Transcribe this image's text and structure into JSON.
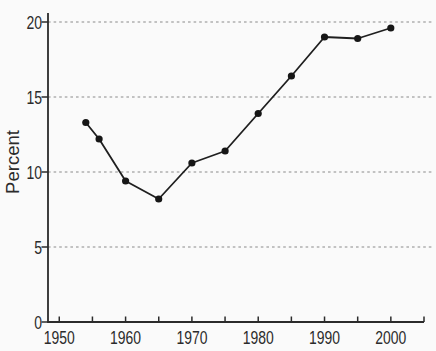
{
  "window": {
    "width": 436,
    "height": 351,
    "background": "#fafafa"
  },
  "chart_data": {
    "type": "line",
    "title": "",
    "xlabel": "",
    "ylabel": "Percent",
    "x": [
      1954,
      1956,
      1960,
      1965,
      1970,
      1975,
      1980,
      1985,
      1990,
      1995,
      2000
    ],
    "y": [
      13.3,
      12.2,
      9.4,
      8.2,
      10.6,
      11.4,
      13.9,
      16.4,
      19.0,
      18.9,
      19.6
    ],
    "xlim": [
      1948.3,
      2005
    ],
    "ylim": [
      0,
      20.6
    ],
    "xticks": [
      1950,
      1955,
      1960,
      1965,
      1970,
      1975,
      1980,
      1985,
      1990,
      1995,
      2000,
      2005
    ],
    "xtick_labels": [
      "1950",
      "",
      "1960",
      "",
      "1970",
      "",
      "1980",
      "",
      "1990",
      "",
      "2000",
      ""
    ],
    "yticks": [
      0,
      5,
      10,
      15,
      20
    ],
    "ytick_labels": [
      "0",
      "5",
      "10",
      "15",
      "20"
    ],
    "grid_values": [
      5,
      10,
      15,
      20
    ],
    "grid_style": "dashed-horizontal",
    "legend": "none",
    "marker": "filled-circle",
    "colors": {
      "line": "#1f1f1f",
      "marker": "#161616",
      "axis": "#2b2b2b",
      "text": "#2b2b2b",
      "grid": "#8a8a8a",
      "background": "#fafafa"
    }
  }
}
